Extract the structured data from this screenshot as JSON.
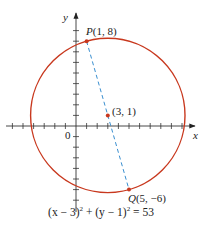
{
  "figure": {
    "axes": {
      "x_label": "x",
      "y_label": "y",
      "origin_label": "0",
      "x_range": [
        -4,
        11
      ],
      "y_range": [
        -8,
        10
      ],
      "tick_spacing": 1
    },
    "circle": {
      "center": [
        3,
        1
      ],
      "radius_squared": 53,
      "color": "#c8381e"
    },
    "points": [
      {
        "name": "P",
        "coords": "(1, 8)",
        "x": 1,
        "y": 8
      },
      {
        "name": "Q",
        "coords": "(5, −6)",
        "x": 5,
        "y": -6
      },
      {
        "name": "center",
        "coords": "(3, 1)",
        "x": 3,
        "y": 1
      }
    ],
    "labels": {
      "p_name": "P",
      "p_coords": "(1, 8)",
      "q_name": "Q",
      "q_coords": "(5, −6)",
      "center_coords": "(3, 1)"
    },
    "diameter_segment": {
      "from": "P",
      "to": "Q",
      "style": "dashed",
      "color": "#3a8fd0"
    },
    "equation": {
      "part1": "(x − 3)",
      "exp1": "2",
      "part2": " + (y − 1)",
      "exp2": "2",
      "part3": " = 53"
    }
  }
}
